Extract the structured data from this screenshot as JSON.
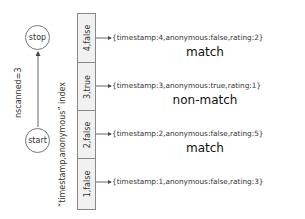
{
  "diagram": {
    "nodes": {
      "stop": {
        "label": "stop"
      },
      "start": {
        "label": "start"
      }
    },
    "edge_label": "nscanned=3",
    "index_label": "“timestamp,anonymous” index",
    "index_entries": [
      {
        "key": "4,false",
        "document": "{timestamp:4,anonymous:false,rating:2}"
      },
      {
        "key": "3,true",
        "document": "{timestamp:3,anonymous:true,rating:1}"
      },
      {
        "key": "2,false",
        "document": "{timestamp:2,anonymous:false,rating:5}"
      },
      {
        "key": "1,false",
        "document": "{timestamp:1,anonymous:false,rating:3}"
      }
    ],
    "verdicts": [
      {
        "label": "match"
      },
      {
        "label": "non-match"
      },
      {
        "label": "match"
      }
    ],
    "colors": {
      "line": "#555555",
      "box_fill": "#f1f1f1",
      "box_border": "#888888"
    }
  }
}
